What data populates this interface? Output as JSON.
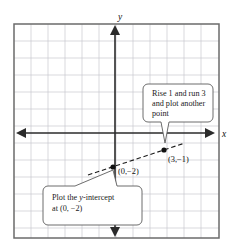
{
  "figure": {
    "type": "coordinate-graph",
    "axes": {
      "x_label": "x",
      "y_label": "y",
      "origin_px": [
        113,
        133
      ],
      "cell_px": 17,
      "grid": true,
      "grid_color": "#c9c9cf",
      "frame_color": "#6b6b6b",
      "axis_color": "#2b2b2b"
    },
    "line": {
      "style": "dashed",
      "color": "#1a1a1a",
      "slope": "1/3",
      "y_intercept": -2
    },
    "points": [
      {
        "id": "y-intercept",
        "label": "(0,−2)",
        "x": 0,
        "y": -2,
        "px": [
          113,
          167
        ]
      },
      {
        "id": "second-point",
        "label": "(3,−1)",
        "x": 3,
        "y": -1,
        "px": [
          164,
          150
        ]
      }
    ],
    "callouts": [
      {
        "id": "rise-run-callout",
        "lines": [
          "Rise 1 and run 3",
          "and plot another",
          "point"
        ],
        "points_to": "second-point"
      },
      {
        "id": "y-intercept-callout",
        "lines_rich": [
          {
            "pre": "Plot the ",
            "ital": "y",
            "post": "-intercept"
          },
          {
            "pre": "at (0, −2)",
            "ital": "",
            "post": ""
          }
        ],
        "lines": [
          "Plot the y-intercept",
          "at (0, −2)"
        ],
        "points_to": "y-intercept"
      }
    ]
  }
}
